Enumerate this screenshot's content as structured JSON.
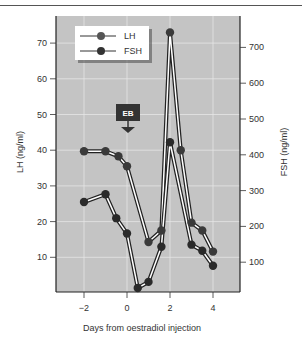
{
  "chart_data": {
    "type": "line",
    "title": "",
    "xlabel": "Days from oestradiol injection",
    "ylabel": "LH (ng/ml)",
    "y2label": "FSH (ng/ml)",
    "xlim": [
      -2.5,
      5
    ],
    "ylim": [
      0,
      75
    ],
    "y2lim": [
      0,
      750
    ],
    "x_ticks": [
      -2,
      0,
      2,
      4
    ],
    "y_ticks": [
      10,
      20,
      30,
      40,
      50,
      60,
      70
    ],
    "y2_ticks": [
      100,
      200,
      300,
      400,
      500,
      600,
      700
    ],
    "grid": true,
    "legend": {
      "position": "upper-left",
      "entries": [
        "LH",
        "FSH"
      ]
    },
    "annotation": {
      "label": "EB",
      "x": 0,
      "arrow": "down"
    },
    "series": [
      {
        "name": "LH",
        "axis": "left",
        "x": [
          -2,
          -1,
          -0.4,
          0,
          1,
          1.6,
          2,
          2.5,
          3,
          3.5,
          4
        ],
        "values": [
          39.7,
          39.7,
          38.3,
          35.5,
          14.3,
          17.5,
          73,
          40,
          19.7,
          17.5,
          11.6
        ]
      },
      {
        "name": "FSH",
        "axis": "right",
        "x": [
          -2,
          -1,
          -0.5,
          0,
          0.5,
          1,
          1.6,
          2,
          3,
          3.5,
          4
        ],
        "values": [
          268,
          290,
          223,
          180,
          28,
          45,
          143,
          435,
          149,
          132,
          90
        ]
      }
    ]
  },
  "legend": {
    "lh": "LH",
    "fsh": "FSH"
  },
  "annotation_label": "EB",
  "axes": {
    "xlabel": "Days from oestradiol injection",
    "ylabel": "LH (ng/ml)",
    "y2label": "FSH (ng/ml)"
  },
  "ticks": {
    "x": [
      "−2",
      "0",
      "2",
      "4"
    ],
    "y": [
      "10",
      "20",
      "30",
      "40",
      "50",
      "60",
      "70"
    ],
    "y2": [
      "100",
      "200",
      "300",
      "400",
      "500",
      "600",
      "700"
    ]
  }
}
